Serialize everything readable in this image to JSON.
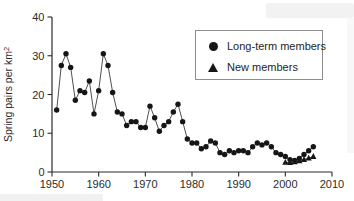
{
  "colors": {
    "marker": "#161616",
    "line": "#3c3c3c",
    "axis": "#2b2b2b",
    "text": "#2b2b2b",
    "legend_border": "#8d8d8d",
    "background": "#ffffff"
  },
  "legend": {
    "items": [
      {
        "label": "Long-term members",
        "marker": "circle"
      },
      {
        "label": "New members",
        "marker": "triangle"
      }
    ]
  },
  "chart_data": {
    "type": "line",
    "title": "",
    "xlabel": "",
    "ylabel": "Spring pairs per km2",
    "ylabel_base": "Spring pairs per km",
    "ylabel_superscript": "2",
    "xlim": [
      1950,
      2010
    ],
    "ylim": [
      0,
      40
    ],
    "x_ticks": [
      1950,
      1960,
      1970,
      1980,
      1990,
      2000,
      2010
    ],
    "y_ticks": [
      0,
      10,
      20,
      30,
      40
    ],
    "grid": false,
    "legend_position": "top-right",
    "series": [
      {
        "name": "Long-term members",
        "marker": "circle",
        "x": [
          1951,
          1952,
          1953,
          1954,
          1955,
          1956,
          1957,
          1958,
          1959,
          1960,
          1961,
          1962,
          1963,
          1964,
          1965,
          1966,
          1967,
          1968,
          1969,
          1970,
          1971,
          1972,
          1973,
          1974,
          1975,
          1976,
          1977,
          1978,
          1979,
          1980,
          1981,
          1982,
          1983,
          1984,
          1985,
          1986,
          1987,
          1988,
          1989,
          1990,
          1991,
          1992,
          1993,
          1994,
          1995,
          1996,
          1997,
          1998,
          1999,
          2000,
          2001,
          2002,
          2003,
          2004,
          2005,
          2006
        ],
        "y": [
          16,
          27.5,
          30.5,
          27,
          18.5,
          21,
          20.5,
          23.5,
          15,
          21,
          30.5,
          27.5,
          20.5,
          15.5,
          15,
          12,
          13,
          13,
          11.5,
          11.5,
          17,
          14,
          10.5,
          12,
          13,
          15.5,
          17.5,
          13,
          8.5,
          7.5,
          7.5,
          6,
          6.5,
          8,
          7.5,
          5,
          4.5,
          5.5,
          5,
          5.5,
          5.5,
          5,
          6.5,
          7.5,
          7,
          7.5,
          6.5,
          5,
          4.5,
          4,
          3.2,
          3,
          3.5,
          4.5,
          5.5,
          6.5
        ]
      },
      {
        "name": "New members",
        "marker": "triangle",
        "x": [
          2000,
          2001,
          2002,
          2003,
          2004,
          2005,
          2006
        ],
        "y": [
          2.5,
          2.4,
          2.6,
          2.9,
          3.2,
          3.6,
          4.0
        ]
      }
    ]
  }
}
